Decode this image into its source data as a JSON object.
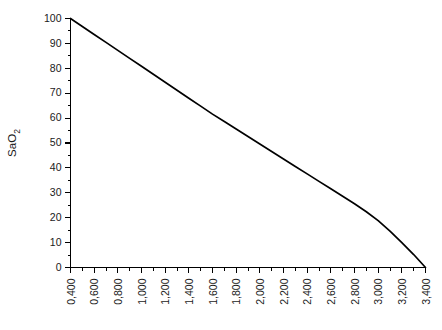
{
  "chart_data": {
    "type": "line",
    "title": "",
    "subtitle": "",
    "xlabel": "",
    "ylabel": "SaO2",
    "ylabel_display": "SaO",
    "ylabel_subscript": "2",
    "xlim": [
      0.4,
      3.4
    ],
    "ylim": [
      0,
      100
    ],
    "grid": false,
    "legend": null,
    "legend_position": "none",
    "decimal_separator": ",",
    "x_tick_labels": [
      "0,400",
      "0,600",
      "0,800",
      "1,000",
      "1,200",
      "1,400",
      "1,600",
      "1,800",
      "2,000",
      "2,200",
      "2,400",
      "2,600",
      "2,800",
      "3,000",
      "3,200",
      "3,400"
    ],
    "x_tick_values": [
      0.4,
      0.6,
      0.8,
      1.0,
      1.2,
      1.4,
      1.6,
      1.8,
      2.0,
      2.2,
      2.4,
      2.6,
      2.8,
      3.0,
      3.2,
      3.4
    ],
    "x_minor_step": 0.1,
    "y_tick_labels": [
      "0",
      "10",
      "20",
      "30",
      "40",
      "50",
      "60",
      "70",
      "80",
      "90",
      "100"
    ],
    "y_tick_values": [
      0,
      10,
      20,
      30,
      40,
      50,
      60,
      70,
      80,
      90,
      100
    ],
    "y_minor_step": 5,
    "series": [
      {
        "name": "SaO2 curve",
        "color": "#000000",
        "x": [
          0.4,
          0.5,
          0.6,
          0.7,
          0.8,
          0.9,
          1.0,
          1.1,
          1.2,
          1.3,
          1.4,
          1.5,
          1.6,
          1.7,
          1.8,
          1.9,
          2.0,
          2.1,
          2.2,
          2.3,
          2.4,
          2.5,
          2.6,
          2.7,
          2.8,
          2.9,
          3.0,
          3.1,
          3.2,
          3.3,
          3.4
        ],
        "y": [
          100.0,
          96.8,
          93.6,
          90.4,
          87.2,
          84.0,
          80.8,
          77.6,
          74.4,
          71.2,
          68.0,
          64.8,
          61.6,
          58.6,
          55.6,
          52.6,
          49.6,
          46.6,
          43.6,
          40.6,
          37.6,
          34.6,
          31.6,
          28.6,
          25.6,
          22.4,
          18.8,
          14.6,
          10.0,
          5.2,
          0.0
        ]
      }
    ]
  }
}
